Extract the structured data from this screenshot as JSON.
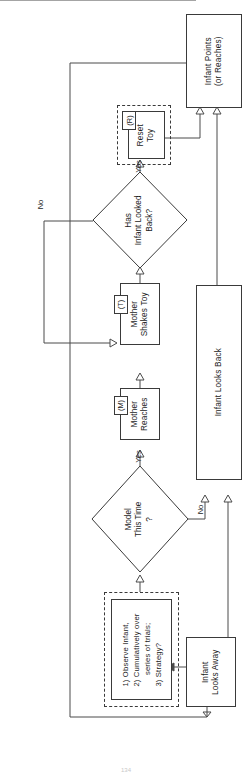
{
  "diagram": {
    "orientation": "rotated-90-ccw",
    "page_number": "134"
  },
  "nodes": {
    "infant_points": {
      "label": "Infant Points\n(or Reaches)",
      "shape": "process"
    },
    "reset_toy": {
      "label": "Reset\nToy",
      "shape": "process",
      "tag": "(R)"
    },
    "has_infant_looked_back": {
      "label": "Has\nInfant Looked\nBack?",
      "shape": "decision"
    },
    "mother_shakes_toy": {
      "label": "Mother\nShakes Toy",
      "shape": "process",
      "tag": "(T)"
    },
    "mother_reaches": {
      "label": "Mother\nReaches",
      "shape": "process",
      "tag": "(M)"
    },
    "infant_looks_back": {
      "label": "Infant Looks Back",
      "shape": "process"
    },
    "model_this_time": {
      "label": "Model\nThis Time\n?",
      "shape": "decision"
    },
    "observe_infant": {
      "label": "1) Observe Infant,\n2) Cumulatively over\n     series of trials;\n3) Strategy?",
      "shape": "process"
    },
    "infant_looks_away": {
      "label": "Infant\nLooks Away",
      "shape": "process"
    }
  },
  "edge_labels": {
    "looked_back_yes": "Yes",
    "looked_back_no": "No",
    "model_yes": "Yes",
    "model_no": "No"
  },
  "tags": {
    "reset_toy": "(R)",
    "mother_shakes_toy": "(T)",
    "mother_reaches": "(M)"
  },
  "colors": {
    "stroke": "#4a4a4a",
    "node_border": "#3a3a3a",
    "text": "#1c1c1c",
    "background": "#ffffff"
  }
}
